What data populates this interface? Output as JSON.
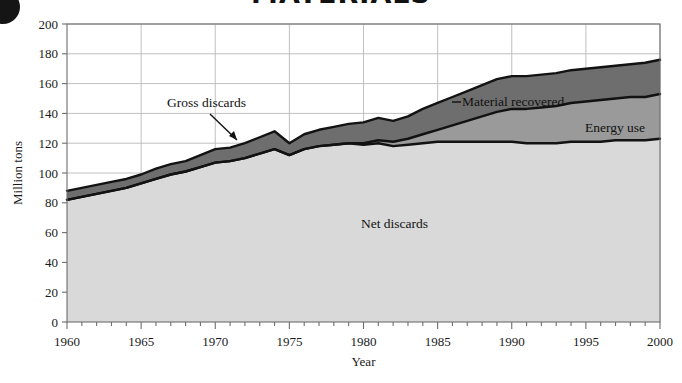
{
  "figure": {
    "bullet_icon": "filled-circle-bullet",
    "title_partial": "MATERIALS"
  },
  "chart_data": {
    "type": "area",
    "stacked": true,
    "title": "",
    "xlabel": "Year",
    "ylabel": "Million tons",
    "xlim": [
      1960,
      2000
    ],
    "ylim": [
      0,
      200
    ],
    "ytick_step": 20,
    "xtick_major_step": 5,
    "xtick_minor_step": 1,
    "grid": true,
    "legend_position": "inline-annotations",
    "xticks": [
      1960,
      1965,
      1970,
      1975,
      1980,
      1985,
      1990,
      1995,
      2000
    ],
    "yticks": [
      0,
      20,
      40,
      60,
      80,
      100,
      120,
      140,
      160,
      180,
      200
    ],
    "annotations": [
      {
        "text": "Gross discards",
        "kind": "callout-with-arrow",
        "points_to_year": 1974
      },
      {
        "text": "Material recovered",
        "kind": "inline-band-label",
        "band": "material_recovered"
      },
      {
        "text": "Energy use",
        "kind": "inline-band-label",
        "band": "energy_use"
      },
      {
        "text": "Net discards",
        "kind": "inline-band-label",
        "band": "net_discards"
      }
    ],
    "colors": {
      "net_discards": "#d9d9d9",
      "energy_use": "#9a9a9a",
      "material_recovered": "#6e6e6e",
      "line": "#121212",
      "grid": "#b9b9b9",
      "axis": "#6e6e6e"
    },
    "x": [
      1960,
      1961,
      1962,
      1963,
      1964,
      1965,
      1966,
      1967,
      1968,
      1969,
      1970,
      1971,
      1972,
      1973,
      1974,
      1975,
      1976,
      1977,
      1978,
      1979,
      1980,
      1981,
      1982,
      1983,
      1984,
      1985,
      1986,
      1987,
      1988,
      1989,
      1990,
      1991,
      1992,
      1993,
      1994,
      1995,
      1996,
      1997,
      1998,
      1999,
      2000
    ],
    "series": [
      {
        "name": "Net discards",
        "key": "net_discards",
        "values": [
          82,
          84,
          86,
          88,
          90,
          93,
          96,
          99,
          101,
          104,
          107,
          108,
          110,
          113,
          116,
          112,
          116,
          118,
          119,
          120,
          119,
          120,
          118,
          119,
          120,
          121,
          121,
          121,
          121,
          121,
          121,
          120,
          120,
          120,
          121,
          121,
          121,
          122,
          122,
          122,
          123
        ]
      },
      {
        "name": "Energy use",
        "key": "energy_use",
        "values": [
          0,
          0,
          0,
          0,
          0,
          0,
          0,
          0,
          0,
          0,
          0,
          0,
          0,
          0,
          0,
          0,
          0,
          0,
          0,
          0,
          1,
          2,
          3,
          4,
          6,
          8,
          11,
          14,
          17,
          20,
          22,
          23,
          24,
          25,
          26,
          27,
          28,
          28,
          29,
          29,
          30
        ]
      },
      {
        "name": "Material recovered",
        "key": "material_recovered",
        "values": [
          6,
          6,
          6,
          6,
          6,
          6,
          7,
          7,
          7,
          8,
          9,
          9,
          10,
          11,
          12,
          8,
          10,
          11,
          12,
          13,
          14,
          15,
          14,
          15,
          17,
          18,
          19,
          20,
          21,
          22,
          22,
          22,
          22,
          22,
          22,
          22,
          22,
          22,
          22,
          23,
          23
        ]
      }
    ],
    "total_series": {
      "name": "Gross discards",
      "values": [
        88,
        90,
        92,
        94,
        96,
        99,
        103,
        106,
        108,
        112,
        116,
        117,
        120,
        124,
        128,
        120,
        126,
        129,
        131,
        133,
        134,
        137,
        135,
        138,
        143,
        147,
        151,
        155,
        159,
        163,
        165,
        165,
        166,
        167,
        169,
        170,
        171,
        172,
        173,
        174,
        176
      ]
    }
  }
}
